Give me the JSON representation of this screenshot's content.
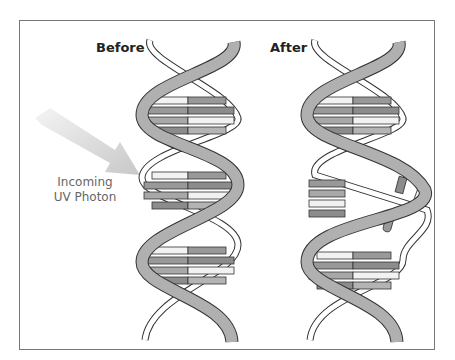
{
  "diagram": {
    "title_before": "Before",
    "title_after": "After",
    "photon_label_line1": "Incoming",
    "photon_label_line2": "UV Photon",
    "colors": {
      "strand": "#b0b0b0",
      "outline": "#333333",
      "rung_dark": "#8c8c8c",
      "rung_mid": "#b4b4b4",
      "rung_light": "#f2f2f2",
      "arrow": "#d4d4d4"
    }
  }
}
